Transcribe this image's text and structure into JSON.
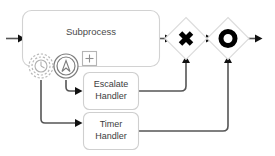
{
  "diagram": {
    "canvas": {
      "width": 275,
      "height": 156,
      "background": "#ffffff"
    },
    "colors": {
      "shape_border": "#d2d2d2",
      "task_border": "#cfcfcf",
      "gateway_border": "#dcdcdc",
      "flow_line": "#555555",
      "arrow_head": "#111111",
      "label_text": "#4a4a4a",
      "event_solid": "#7d7d7d",
      "event_dashed": "#b9b9b9",
      "gateway_glyph": "#000000"
    },
    "nodes": {
      "subprocess": {
        "label": "Subprocess",
        "type": "collapsed-subprocess",
        "marker": "+"
      },
      "escalate_handler": {
        "type": "task",
        "label_line1": "Escalate",
        "label_line2": "Handler"
      },
      "timer_handler": {
        "type": "task",
        "label_line1": "Timer",
        "label_line2": "Handler"
      },
      "timer_boundary_event": {
        "type": "boundary-event",
        "event_kind": "timer",
        "interrupting": "non-interrupting",
        "icon": "clock-icon"
      },
      "escalation_boundary_event": {
        "type": "boundary-event",
        "event_kind": "escalation",
        "interrupting": "interrupting",
        "icon": "escalation-arrow-icon"
      },
      "exclusive_gateway": {
        "type": "gateway",
        "gateway_kind": "exclusive",
        "icon": "x-gateway-icon",
        "symbol": "X"
      },
      "inclusive_gateway": {
        "type": "gateway",
        "gateway_kind": "inclusive",
        "icon": "o-gateway-icon",
        "symbol": "O"
      }
    },
    "flows": [
      {
        "name": "start-to-subprocess",
        "from": "start",
        "to": "subprocess"
      },
      {
        "name": "subprocess-to-exclusive-gateway",
        "from": "subprocess",
        "to": "exclusive_gateway"
      },
      {
        "name": "escalation-event-to-escalate-handler",
        "from": "escalation_boundary_event",
        "to": "escalate_handler"
      },
      {
        "name": "timer-event-to-timer-handler",
        "from": "timer_boundary_event",
        "to": "timer_handler"
      },
      {
        "name": "escalate-handler-to-exclusive-gateway",
        "from": "escalate_handler",
        "to": "exclusive_gateway"
      },
      {
        "name": "timer-handler-to-inclusive-gateway",
        "from": "timer_handler",
        "to": "inclusive_gateway"
      },
      {
        "name": "exclusive-gateway-to-inclusive-gateway",
        "from": "exclusive_gateway",
        "to": "inclusive_gateway"
      },
      {
        "name": "inclusive-gateway-to-end",
        "from": "inclusive_gateway",
        "to": "end"
      }
    ]
  }
}
